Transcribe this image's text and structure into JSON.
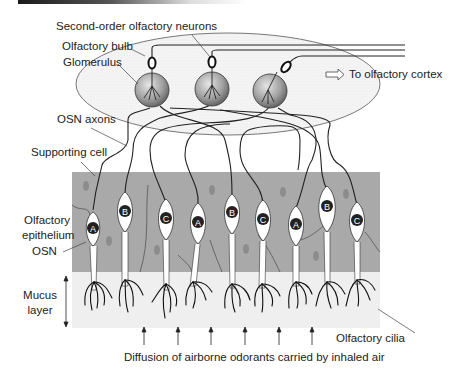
{
  "title_bar": {
    "style": "gradient black line"
  },
  "labels": {
    "second_order": "Second-order olfactory neurons",
    "bulb": "Olfactory bulb",
    "glomerulus": "Glomerulus",
    "to_cortex": "To olfactory cortex",
    "osn_axons": "OSN axons",
    "supporting_cell": "Supporting cell",
    "epithelium_line1": "Olfactory",
    "epithelium_line2": "epithelium",
    "osn": "OSN",
    "mucus_line1": "Mucus",
    "mucus_line2": "layer",
    "cilia": "Olfactory cilia",
    "diffusion": "Diffusion of airborne odorants carried by inhaled air"
  },
  "neurons": [
    {
      "type": "A",
      "x": 93,
      "y": 228
    },
    {
      "type": "B",
      "x": 125,
      "y": 211
    },
    {
      "type": "C",
      "x": 166,
      "y": 218
    },
    {
      "type": "A",
      "x": 198,
      "y": 222
    },
    {
      "type": "B",
      "x": 232,
      "y": 212
    },
    {
      "type": "C",
      "x": 263,
      "y": 219
    },
    {
      "type": "A",
      "x": 296,
      "y": 224
    },
    {
      "type": "B",
      "x": 327,
      "y": 206
    },
    {
      "type": "C",
      "x": 357,
      "y": 220
    }
  ],
  "glomeruli": [
    {
      "x": 152,
      "y": 90
    },
    {
      "x": 212,
      "y": 89
    },
    {
      "x": 270,
      "y": 91
    }
  ],
  "colors": {
    "epithelium": "#a9a9a9",
    "mucus": "#f0f0f0",
    "bulb_fill": "#f3f3f3",
    "supporting_nucleus": "#8a8a8a",
    "neuron_nucleus": "#222222",
    "line": "#222222"
  }
}
